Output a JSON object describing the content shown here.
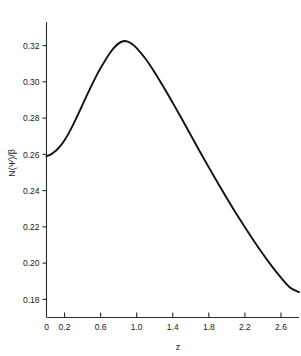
{
  "chart_data": {
    "type": "line",
    "title": "",
    "xlabel": "z",
    "ylabel": "N(Ψ̇)/β",
    "xlim": [
      0,
      2.8
    ],
    "ylim": [
      0.17,
      0.333
    ],
    "grid": false,
    "legend": null,
    "line_color": "#111111",
    "axis_color": "#2b2b2b",
    "background": "#ffffff",
    "x_ticks": [
      0,
      0.2,
      0.6,
      1.0,
      1.4,
      1.8,
      2.2,
      2.6
    ],
    "x_tick_labels": [
      "0",
      "0.2",
      "0.6",
      "1.0",
      "1.4",
      "1.8",
      "2.2",
      "2.6"
    ],
    "y_ticks": [
      0.18,
      0.2,
      0.22,
      0.24,
      0.26,
      0.28,
      0.3,
      0.32
    ],
    "y_tick_labels": [
      "0.18",
      "0.20",
      "0.22",
      "0.24",
      "0.26",
      "0.28",
      "0.30",
      "0.32"
    ],
    "peak": {
      "x": 0.78,
      "y": 0.3225
    },
    "start_point": {
      "x": 0.0,
      "y": 0.259
    },
    "end_point": {
      "x": 2.8,
      "y": 0.184
    },
    "x": [
      0.0,
      0.05,
      0.1,
      0.15,
      0.2,
      0.25,
      0.3,
      0.35,
      0.4,
      0.45,
      0.5,
      0.55,
      0.6,
      0.65,
      0.7,
      0.75,
      0.8,
      0.85,
      0.9,
      0.95,
      1.0,
      1.1,
      1.2,
      1.3,
      1.4,
      1.5,
      1.6,
      1.7,
      1.8,
      1.9,
      2.0,
      2.1,
      2.2,
      2.3,
      2.4,
      2.5,
      2.6,
      2.7,
      2.8
    ],
    "values": [
      0.259,
      0.26,
      0.2618,
      0.2644,
      0.2678,
      0.272,
      0.2768,
      0.282,
      0.2874,
      0.2928,
      0.298,
      0.303,
      0.3076,
      0.3118,
      0.3156,
      0.3188,
      0.3212,
      0.3224,
      0.3222,
      0.3208,
      0.3186,
      0.3126,
      0.3052,
      0.297,
      0.2884,
      0.2796,
      0.2706,
      0.2616,
      0.2528,
      0.2442,
      0.2358,
      0.2276,
      0.2198,
      0.2122,
      0.205,
      0.1982,
      0.192,
      0.1866,
      0.184
    ]
  }
}
